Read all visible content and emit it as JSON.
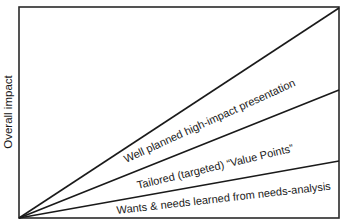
{
  "diagram": {
    "y_axis_label": "Overall impact",
    "lines": [
      {
        "label": "Well planned high-impact presentation",
        "end_y": 8
      },
      {
        "label": "Tailored (targeted) “Value Points”",
        "end_y": 90
      },
      {
        "label": "Wants & needs learned from needs-analysis",
        "end_y": 161
      }
    ],
    "colors": {
      "line": "#1a1a1a",
      "background": "#ffffff"
    }
  }
}
